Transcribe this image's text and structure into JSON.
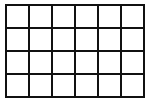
{
  "grid": {
    "columns": 6,
    "rows": 4,
    "line_color": "#111111",
    "cell_color": "#ffffff",
    "cells": [
      "",
      "",
      "",
      "",
      "",
      "",
      "",
      "",
      "",
      "",
      "",
      "",
      "",
      "",
      "",
      "",
      "",
      "",
      "",
      "",
      "",
      "",
      "",
      ""
    ]
  }
}
